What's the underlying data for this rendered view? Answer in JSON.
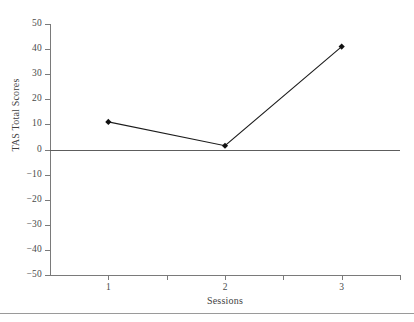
{
  "chart_data": {
    "type": "line",
    "title": "",
    "xlabel": "Sessions",
    "ylabel": "TAS Total Scores",
    "categories": [
      "1",
      "2",
      "3"
    ],
    "x": [
      1,
      2,
      3
    ],
    "values": [
      11,
      1.5,
      41
    ],
    "series": [
      {
        "name": "TAS Total Scores",
        "values": [
          11,
          1.5,
          41
        ]
      }
    ],
    "ylim": [
      -50,
      50
    ],
    "xlim": [
      0.5,
      3.5
    ],
    "yticks": [
      "50",
      "40",
      "30",
      "20",
      "10",
      "0",
      "−10",
      "−20",
      "−30",
      "−40",
      "−50"
    ],
    "ytick_values": [
      50,
      40,
      30,
      20,
      10,
      0,
      -10,
      -20,
      -30,
      -40,
      -50
    ],
    "xticks": [
      "1",
      "2",
      "3"
    ],
    "grid": false,
    "legend": "none",
    "marker": "diamond",
    "line_color": "#1c1c1c",
    "marker_color": "#111111",
    "axis_color": "#7a7a7a",
    "zero_line_color": "#5d5d5d",
    "background": "#ffffff"
  }
}
